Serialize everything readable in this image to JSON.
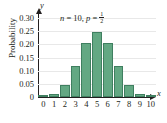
{
  "chart_data": {
    "type": "bar",
    "title": "",
    "annotation": "n = 10, p = 1/2",
    "annotation_parts": {
      "n_var": "n",
      "eq1": " = ",
      "n_val": "10",
      "comma": ", ",
      "p_var": "p",
      "eq2": " = ",
      "frac_num": "1",
      "frac_den": "2"
    },
    "xlabel": "",
    "ylabel": "Probability",
    "x_axis_name": "x",
    "y_axis_name": "y",
    "categories": [
      "0",
      "1",
      "2",
      "3",
      "4",
      "5",
      "6",
      "7",
      "8",
      "9",
      "10"
    ],
    "values": [
      0.001,
      0.01,
      0.044,
      0.117,
      0.205,
      0.246,
      0.205,
      0.117,
      0.044,
      0.01,
      0.001
    ],
    "ylim": [
      0,
      0.3
    ],
    "xlim": [
      -0.6,
      10.6
    ],
    "y_ticks": [
      "0",
      "0.05",
      "0.10",
      "0.15",
      "0.20",
      "0.25",
      "0.30"
    ],
    "y_tick_values": [
      0,
      0.05,
      0.1,
      0.15,
      0.2,
      0.25,
      0.3
    ],
    "x_ticks": [
      "0",
      "1",
      "2",
      "3",
      "4",
      "5",
      "6",
      "7",
      "8",
      "9",
      "10"
    ],
    "grid": true,
    "legend": null,
    "colors": {
      "bar_fill": "#63a883",
      "bar_edge": "#3f7f60",
      "axis": "#231f20",
      "grid": "#e8e8e8",
      "background": "#ffffff"
    }
  }
}
